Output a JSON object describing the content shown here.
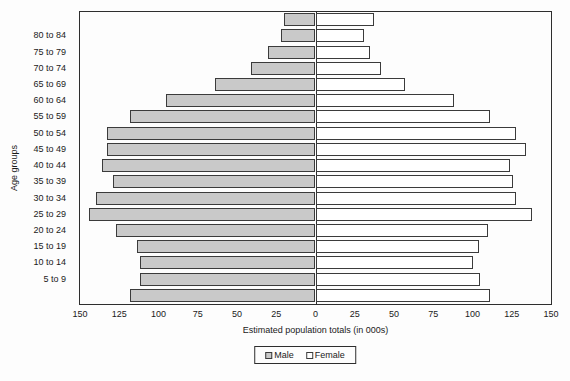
{
  "chart_data": {
    "type": "bar",
    "subtype": "population-pyramid",
    "orientation": "horizontal",
    "title": "",
    "xlabel": "Estimated population totals (in 000s)",
    "ylabel": "Age groups",
    "grid": false,
    "legend_position": "bottom-center",
    "axis": {
      "tick_labels": [
        "150",
        "125",
        "100",
        "75",
        "50",
        "25",
        "0",
        "25",
        "50",
        "75",
        "100",
        "125",
        "150"
      ],
      "tick_values": [
        -150,
        -125,
        -100,
        -75,
        -50,
        -25,
        0,
        25,
        50,
        75,
        100,
        125,
        150
      ],
      "xlim_abs": 150
    },
    "categories_top_to_bottom": [
      "",
      "80 to 84",
      "75 to 79",
      "70 to 74",
      "65 to 69",
      "60 to 64",
      "55 to 59",
      "50 to 54",
      "45 to 49",
      "40 to 44",
      "35 to 39",
      "30 to 34",
      "25 to 29",
      "20 to 24",
      "15 to 19",
      "10 to 14",
      "5 to 9",
      ""
    ],
    "series": [
      {
        "name": "Male",
        "side": "left",
        "fill": "#c9c9c9",
        "values_top_to_bottom": [
          20,
          22,
          30,
          41,
          64,
          95,
          118,
          133,
          133,
          136,
          129,
          140,
          144,
          127,
          114,
          112,
          112,
          118
        ]
      },
      {
        "name": "Female",
        "side": "right",
        "fill": "#ffffff",
        "values_top_to_bottom": [
          37,
          31,
          35,
          42,
          57,
          88,
          111,
          128,
          134,
          124,
          126,
          128,
          138,
          110,
          104,
          100,
          105,
          111
        ]
      }
    ],
    "colors": {
      "bar_border": "#3b3b3b",
      "axis_border": "#2e2e2e",
      "background": "#fdfdfd",
      "text": "#1a1a1a"
    }
  }
}
